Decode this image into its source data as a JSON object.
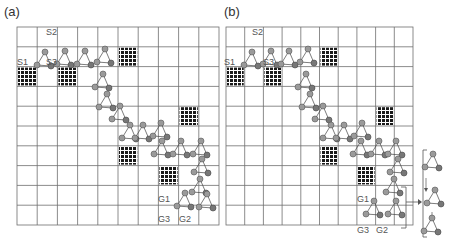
{
  "panels": [
    {
      "label": "(a)",
      "labels": {
        "s1": "S1",
        "s2": "S2",
        "s3": "S3",
        "g1": "G1",
        "g2": "G2",
        "g3": "G3"
      }
    },
    {
      "label": "(b)",
      "labels": {
        "s1": "S1",
        "s2": "S2",
        "s3": "S3",
        "g1": "G1",
        "g2": "G2",
        "g3": "G3"
      }
    }
  ],
  "grid": {
    "columns": 10,
    "rows": 10
  },
  "obstacles": [
    [
      0,
      2
    ],
    [
      2,
      2
    ],
    [
      5,
      1
    ],
    [
      8,
      4
    ],
    [
      5,
      6
    ],
    [
      7,
      7
    ]
  ],
  "colors": {
    "grid": "#6e6e6e",
    "obstacle": "#1a1a1a",
    "node_fill": "#9a9a9a",
    "node_stroke": "#555555"
  }
}
